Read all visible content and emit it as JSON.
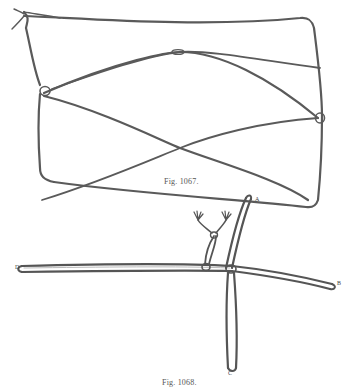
{
  "figures": [
    {
      "id": "fig-1067",
      "caption": "Fig. 1067."
    },
    {
      "id": "fig-1068",
      "caption": "Fig. 1068.",
      "labels": {
        "top": "A",
        "left": "D",
        "right": "B",
        "bottom": "C"
      }
    }
  ],
  "colors": {
    "line": "#555555",
    "line_light": "#9a9a9a",
    "background": "#ffffff"
  }
}
